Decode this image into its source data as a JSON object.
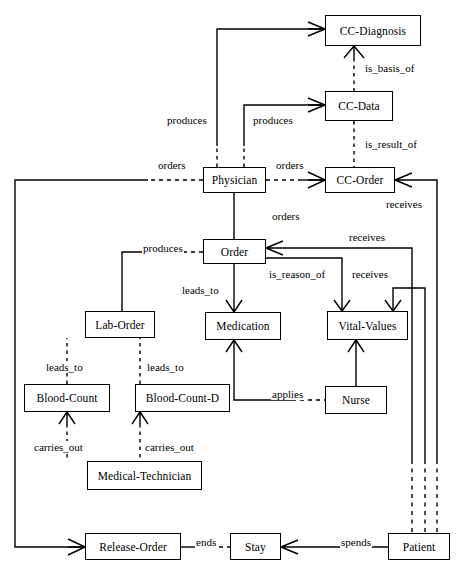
{
  "diagram": {
    "stroke_color": "#000000",
    "background_color": "#ffffff",
    "nodes": [
      {
        "id": "cc-diagnosis",
        "label": "CC-Diagnosis",
        "x": 325,
        "y": 15,
        "w": 96,
        "h": 31
      },
      {
        "id": "cc-data",
        "label": "CC-Data",
        "x": 325,
        "y": 91,
        "w": 68,
        "h": 30
      },
      {
        "id": "cc-order",
        "label": "CC-Order",
        "x": 325,
        "y": 167,
        "w": 70,
        "h": 26
      },
      {
        "id": "physician",
        "label": "Physician",
        "x": 203,
        "y": 167,
        "w": 63,
        "h": 26
      },
      {
        "id": "order",
        "label": "Order",
        "x": 203,
        "y": 239,
        "w": 63,
        "h": 25
      },
      {
        "id": "lab-order",
        "label": "Lab-Order",
        "x": 85,
        "y": 311,
        "w": 70,
        "h": 27
      },
      {
        "id": "medication",
        "label": "Medication",
        "x": 205,
        "y": 312,
        "w": 76,
        "h": 28
      },
      {
        "id": "vital-values",
        "label": "Vital-Values",
        "x": 327,
        "y": 311,
        "w": 81,
        "h": 29
      },
      {
        "id": "blood-count",
        "label": "Blood-Count",
        "x": 24,
        "y": 384,
        "w": 86,
        "h": 28
      },
      {
        "id": "blood-count-d",
        "label": "Blood-Count-D",
        "x": 135,
        "y": 384,
        "w": 95,
        "h": 28
      },
      {
        "id": "nurse",
        "label": "Nurse",
        "x": 325,
        "y": 386,
        "w": 62,
        "h": 28
      },
      {
        "id": "medical-technician",
        "label": "Medical-Technician",
        "x": 87,
        "y": 461,
        "w": 115,
        "h": 29
      },
      {
        "id": "release-order",
        "label": "Release-Order",
        "x": 85,
        "y": 533,
        "w": 96,
        "h": 27
      },
      {
        "id": "stay",
        "label": "Stay",
        "x": 230,
        "y": 533,
        "w": 51,
        "h": 27
      },
      {
        "id": "patient",
        "label": "Patient",
        "x": 388,
        "y": 533,
        "w": 62,
        "h": 27
      }
    ],
    "edge_labels": [
      {
        "id": "is-basis-of",
        "text": "is_basis_of",
        "x": 364,
        "y": 62
      },
      {
        "id": "is-result-of",
        "text": "is_result_of",
        "x": 364,
        "y": 138
      },
      {
        "id": "produces-diagnosis",
        "text": "produces",
        "x": 166,
        "y": 114
      },
      {
        "id": "produces-data",
        "text": "produces",
        "x": 252,
        "y": 114
      },
      {
        "id": "orders-left",
        "text": "orders",
        "x": 157,
        "y": 159
      },
      {
        "id": "orders-right",
        "text": "orders",
        "x": 275,
        "y": 159
      },
      {
        "id": "orders-down",
        "text": "orders",
        "x": 271,
        "y": 210
      },
      {
        "id": "receives-ccorder",
        "text": "receives",
        "x": 385,
        "y": 198
      },
      {
        "id": "produces-laborder",
        "text": "produces",
        "x": 142,
        "y": 242
      },
      {
        "id": "receives-order",
        "text": "receives",
        "x": 348,
        "y": 231
      },
      {
        "id": "is-reason-of",
        "text": "is_reason_of",
        "x": 268,
        "y": 268
      },
      {
        "id": "receives-vital",
        "text": "receives",
        "x": 351,
        "y": 268
      },
      {
        "id": "leads-to-med",
        "text": "leads_to",
        "x": 181,
        "y": 284
      },
      {
        "id": "leads-to-bc",
        "text": "leads_to",
        "x": 45,
        "y": 361
      },
      {
        "id": "leads-to-bcd",
        "text": "leads_to",
        "x": 146,
        "y": 361
      },
      {
        "id": "applies",
        "text": "applies",
        "x": 271,
        "y": 388
      },
      {
        "id": "carries-out-left",
        "text": "carries_out",
        "x": 33,
        "y": 441
      },
      {
        "id": "carries-out-right",
        "text": "carries_out",
        "x": 144,
        "y": 441
      },
      {
        "id": "ends",
        "text": "ends",
        "x": 195,
        "y": 536
      },
      {
        "id": "spends",
        "text": "spends",
        "x": 340,
        "y": 536
      }
    ],
    "relationships": [
      {
        "from": "physician",
        "to": "cc-diagnosis",
        "label": "produces",
        "style": "dashed-elbow"
      },
      {
        "from": "physician",
        "to": "cc-data",
        "label": "produces",
        "style": "dashed-elbow"
      },
      {
        "from": "cc-diagnosis",
        "to": "cc-data",
        "label": "is_basis_of",
        "style": "dashed"
      },
      {
        "from": "cc-data",
        "to": "cc-order",
        "label": "is_result_of",
        "style": "dashed"
      },
      {
        "from": "physician",
        "to": "cc-order",
        "label": "orders",
        "style": "dashed"
      },
      {
        "from": "physician",
        "to": "release-order",
        "label": "orders",
        "style": "dashed-elbow"
      },
      {
        "from": "physician",
        "to": "order",
        "label": "orders",
        "style": "solid"
      },
      {
        "from": "order",
        "to": "lab-order",
        "label": "produces",
        "style": "dashed-elbow"
      },
      {
        "from": "order",
        "to": "medication",
        "label": "leads_to",
        "style": "solid"
      },
      {
        "from": "order",
        "to": "vital-values",
        "label": "is_reason_of",
        "style": "solid-elbow"
      },
      {
        "from": "patient",
        "to": "order",
        "label": "receives",
        "style": "solid-elbow"
      },
      {
        "from": "patient",
        "to": "cc-order",
        "label": "receives",
        "style": "solid-elbow"
      },
      {
        "from": "patient",
        "to": "vital-values",
        "label": "receives",
        "style": "solid-elbow"
      },
      {
        "from": "lab-order",
        "to": "blood-count",
        "label": "leads_to",
        "style": "dashed"
      },
      {
        "from": "lab-order",
        "to": "blood-count-d",
        "label": "leads_to",
        "style": "dashed"
      },
      {
        "from": "blood-count",
        "to": "medical-technician",
        "label": "carries_out",
        "style": "dashed"
      },
      {
        "from": "blood-count-d",
        "to": "medical-technician",
        "label": "carries_out",
        "style": "dashed"
      },
      {
        "from": "medication",
        "to": "nurse",
        "label": "applies",
        "style": "dashed-elbow"
      },
      {
        "from": "vital-values",
        "to": "nurse",
        "label": "applies",
        "style": "solid"
      },
      {
        "from": "release-order",
        "to": "stay",
        "label": "ends",
        "style": "dashed"
      },
      {
        "from": "stay",
        "to": "patient",
        "label": "spends",
        "style": "solid"
      }
    ]
  }
}
